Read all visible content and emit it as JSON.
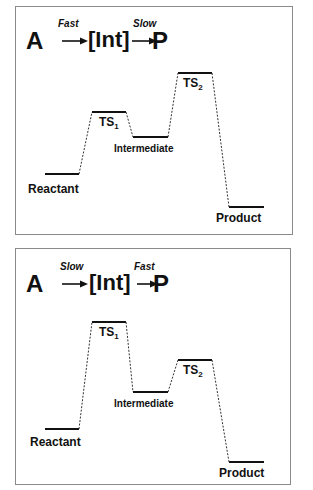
{
  "panels": [
    {
      "id": "fast-slow",
      "scheme": {
        "reactant": "A",
        "intermediate": "[Int]",
        "product": "P",
        "step1_rate": "Fast",
        "step2_rate": "Slow"
      },
      "levels": {
        "reactant": {
          "label": "Reactant",
          "y": 173
        },
        "ts1": {
          "label": "TS",
          "sub": "1",
          "y": 111
        },
        "intermediate": {
          "label": "Intermediate",
          "y": 136
        },
        "ts2": {
          "label": "TS",
          "sub": "2",
          "y": 72
        },
        "product": {
          "label": "Product",
          "y": 206
        }
      }
    },
    {
      "id": "slow-fast",
      "scheme": {
        "reactant": "A",
        "intermediate": "[Int]",
        "product": "P",
        "step1_rate": "Slow",
        "step2_rate": "Fast"
      },
      "levels": {
        "reactant": {
          "label": "Reactant",
          "y": 428
        },
        "ts1": {
          "label": "TS",
          "sub": "1",
          "y": 321
        },
        "intermediate": {
          "label": "Intermediate",
          "y": 391
        },
        "ts2": {
          "label": "TS",
          "sub": "2",
          "y": 359
        },
        "product": {
          "label": "Product",
          "y": 461
        }
      }
    }
  ]
}
